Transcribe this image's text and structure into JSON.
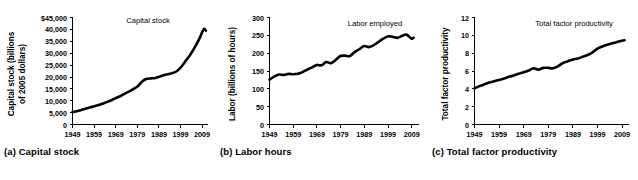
{
  "figure": {
    "background": "#ffffff",
    "line_color": "#000000",
    "panels": [
      {
        "id": "a",
        "caption": "(a) Capital stock",
        "series_label": "Capital stock"
      },
      {
        "id": "b",
        "caption": "(b) Labor hours",
        "series_label": "Labor employed"
      },
      {
        "id": "c",
        "caption": "(c) Total factor productivity",
        "series_label": "Total factor productivity"
      }
    ]
  },
  "chart_data": [
    {
      "type": "line",
      "title": "",
      "panel_caption": "(a) Capital stock",
      "series_label": "Capital stock",
      "xlabel": "",
      "ylabel": "Capital stock (billions of 2005 dollars)",
      "ylabel_lines": [
        "Capital stock (billions",
        "of 2005 dollars)"
      ],
      "xlim": [
        1949,
        2011
      ],
      "ylim": [
        0,
        45000
      ],
      "xticks": [
        1949,
        1959,
        1969,
        1979,
        1989,
        1999,
        2009
      ],
      "xticklabels": [
        "1949",
        "1959",
        "1969",
        "1979",
        "1989",
        "1999",
        "2009"
      ],
      "yticks": [
        0,
        5000,
        10000,
        15000,
        20000,
        25000,
        30000,
        35000,
        40000,
        45000
      ],
      "yticklabels": [
        "0",
        "5,000",
        "10,000",
        "15,000",
        "20,000",
        "25,000",
        "30,000",
        "35,000",
        "40,000",
        "$45,000"
      ],
      "grid": false,
      "legend": "none",
      "x": [
        1949,
        1951,
        1953,
        1955,
        1957,
        1959,
        1961,
        1963,
        1965,
        1967,
        1969,
        1971,
        1973,
        1975,
        1977,
        1979,
        1981,
        1983,
        1985,
        1987,
        1989,
        1991,
        1993,
        1995,
        1997,
        1999,
        2001,
        2003,
        2005,
        2007,
        2009,
        2010
      ],
      "values": [
        5200,
        5600,
        6100,
        6600,
        7200,
        7700,
        8200,
        8800,
        9500,
        10300,
        11200,
        12000,
        13000,
        13900,
        15000,
        16200,
        18200,
        19200,
        19400,
        19600,
        20200,
        20800,
        21200,
        21700,
        22600,
        24500,
        27000,
        29500,
        32500,
        36000,
        40000,
        39500
      ]
    },
    {
      "type": "line",
      "title": "",
      "panel_caption": "(b) Labor hours",
      "series_label": "Labor employed",
      "xlabel": "",
      "ylabel": "Labor (billions of hours)",
      "ylabel_lines": [
        "Labor (billions of hours)"
      ],
      "xlim": [
        1949,
        2011
      ],
      "ylim": [
        0,
        300
      ],
      "xticks": [
        1949,
        1959,
        1969,
        1979,
        1989,
        1999,
        2009
      ],
      "xticklabels": [
        "1949",
        "1959",
        "1969",
        "1979",
        "1989",
        "1999",
        "2009"
      ],
      "yticks": [
        0,
        50,
        100,
        150,
        200,
        250,
        300
      ],
      "yticklabels": [
        "0",
        "50",
        "100",
        "150",
        "200",
        "250",
        "300"
      ],
      "grid": false,
      "legend": "none",
      "x": [
        1949,
        1951,
        1953,
        1955,
        1957,
        1959,
        1961,
        1963,
        1965,
        1967,
        1969,
        1971,
        1973,
        1975,
        1977,
        1979,
        1981,
        1983,
        1985,
        1987,
        1989,
        1991,
        1993,
        1995,
        1997,
        1999,
        2001,
        2003,
        2005,
        2007,
        2009,
        2010
      ],
      "values": [
        126,
        134,
        140,
        139,
        142,
        141,
        142,
        147,
        154,
        160,
        167,
        166,
        175,
        172,
        181,
        192,
        193,
        192,
        203,
        211,
        220,
        217,
        222,
        231,
        240,
        247,
        246,
        243,
        248,
        252,
        241,
        243
      ]
    },
    {
      "type": "line",
      "title": "",
      "panel_caption": "(c) Total factor productivity",
      "series_label": "Total factor productivity",
      "xlabel": "",
      "ylabel": "Total factor productivity",
      "ylabel_lines": [
        "Total factor productivity"
      ],
      "xlim": [
        1949,
        2011
      ],
      "ylim": [
        0,
        12
      ],
      "xticks": [
        1949,
        1959,
        1969,
        1979,
        1989,
        1999,
        2009
      ],
      "xticklabels": [
        "1949",
        "1959",
        "1969",
        "1979",
        "1989",
        "1999",
        "2009"
      ],
      "yticks": [
        0,
        2,
        4,
        6,
        8,
        10,
        12
      ],
      "yticklabels": [
        "0",
        "2",
        "4",
        "6",
        "8",
        "10",
        "12"
      ],
      "grid": false,
      "legend": "none",
      "x": [
        1949,
        1951,
        1953,
        1955,
        1957,
        1959,
        1961,
        1963,
        1965,
        1967,
        1969,
        1971,
        1973,
        1975,
        1977,
        1979,
        1981,
        1983,
        1985,
        1987,
        1989,
        1991,
        1993,
        1995,
        1997,
        1999,
        2001,
        2003,
        2005,
        2007,
        2009,
        2010
      ],
      "values": [
        4.05,
        4.3,
        4.5,
        4.7,
        4.85,
        5.0,
        5.15,
        5.35,
        5.5,
        5.7,
        5.85,
        6.05,
        6.3,
        6.15,
        6.35,
        6.35,
        6.3,
        6.55,
        6.9,
        7.1,
        7.3,
        7.4,
        7.6,
        7.8,
        8.1,
        8.5,
        8.75,
        8.95,
        9.1,
        9.25,
        9.4,
        9.45
      ]
    }
  ]
}
